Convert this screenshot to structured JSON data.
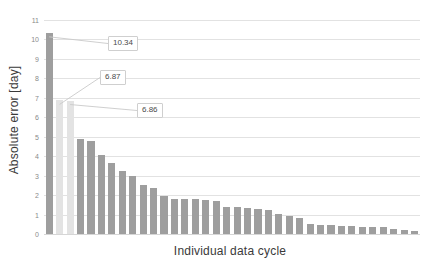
{
  "chart_data": {
    "type": "bar",
    "title": "",
    "xlabel": "Individual data cycle",
    "ylabel": "Absolute error [day]",
    "ylim": [
      0,
      11
    ],
    "yticks": [
      0,
      1,
      2,
      3,
      4,
      5,
      6,
      7,
      8,
      9,
      10,
      11
    ],
    "ytick_labels": [
      "0",
      "1",
      "2",
      "3",
      "4",
      "5",
      "6",
      "7",
      "8",
      "9",
      "10",
      "11"
    ],
    "grid": true,
    "legend": "none",
    "categories": [
      "1",
      "2",
      "3",
      "4",
      "5",
      "6",
      "7",
      "8",
      "9",
      "10",
      "11",
      "12",
      "13",
      "14",
      "15",
      "16",
      "17",
      "18",
      "19",
      "20",
      "21",
      "22",
      "23",
      "24",
      "25",
      "26",
      "27",
      "28",
      "29",
      "30",
      "31",
      "32",
      "33",
      "34",
      "35",
      "36"
    ],
    "values": [
      10.34,
      6.87,
      6.86,
      4.9,
      4.8,
      4.05,
      3.65,
      3.25,
      3.0,
      2.5,
      2.35,
      1.95,
      1.8,
      1.8,
      1.78,
      1.75,
      1.68,
      1.4,
      1.38,
      1.35,
      1.3,
      1.22,
      1.05,
      0.95,
      0.82,
      0.5,
      0.45,
      0.44,
      0.42,
      0.4,
      0.38,
      0.36,
      0.34,
      0.26,
      0.2,
      0.16
    ],
    "bar_colors": [
      "#9e9e9e",
      "#e3e3e3",
      "#e3e3e3",
      "#9e9e9e",
      "#9e9e9e",
      "#9e9e9e",
      "#9e9e9e",
      "#9e9e9e",
      "#9e9e9e",
      "#9e9e9e",
      "#9e9e9e",
      "#9e9e9e",
      "#9e9e9e",
      "#9e9e9e",
      "#9e9e9e",
      "#9e9e9e",
      "#9e9e9e",
      "#9e9e9e",
      "#9e9e9e",
      "#9e9e9e",
      "#9e9e9e",
      "#9e9e9e",
      "#9e9e9e",
      "#9e9e9e",
      "#9e9e9e",
      "#9e9e9e",
      "#9e9e9e",
      "#9e9e9e",
      "#9e9e9e",
      "#9e9e9e",
      "#9e9e9e",
      "#9e9e9e",
      "#9e9e9e",
      "#9e9e9e",
      "#9e9e9e",
      "#9e9e9e"
    ],
    "annotations": [
      {
        "text": "10.34",
        "point_index": 0,
        "box_x": 64,
        "box_y": 16
      },
      {
        "text": "6.87",
        "point_index": 1,
        "box_x": 56,
        "box_y": 50
      },
      {
        "text": "6.86",
        "point_index": 2,
        "box_x": 93,
        "box_y": 83
      }
    ],
    "colors": {
      "bar_primary": "#9e9e9e",
      "bar_highlight": "#e3e3e3",
      "gridline": "#e2e2e2",
      "tick_text": "#8a8a8a",
      "axis_title": "#3a3a3a",
      "callout_border": "#cfcfcf",
      "background": "#ffffff"
    }
  }
}
